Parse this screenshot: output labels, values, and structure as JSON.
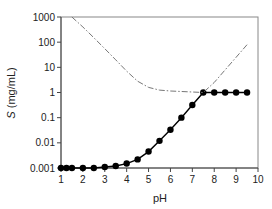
{
  "chart_data": {
    "type": "line",
    "title": "",
    "xlabel": "pH",
    "ylabel_italic": "S",
    "ylabel_rest": " (mg/mL)",
    "ylabel": "S (mg/mL)",
    "xlim": [
      1,
      10
    ],
    "ylim": [
      0.001,
      1000
    ],
    "yscale": "log",
    "grid": false,
    "legend": null,
    "x_ticks": [
      1,
      2,
      3,
      4,
      5,
      6,
      7,
      8,
      9,
      10
    ],
    "x_tick_labels": [
      "1",
      "2",
      "3",
      "4",
      "5",
      "6",
      "7",
      "8",
      "9",
      "10"
    ],
    "y_ticks": [
      0.001,
      0.01,
      0.1,
      1,
      10,
      100,
      1000
    ],
    "y_tick_labels": [
      "0.001",
      "0.01",
      "0.1",
      "1",
      "10",
      "100",
      "1000"
    ],
    "series": [
      {
        "name": "measured solubility",
        "style": "solid-markers",
        "color": "#000000",
        "x": [
          1,
          1.25,
          1.5,
          2,
          2.5,
          3,
          3.5,
          4,
          4.5,
          5,
          5.5,
          6,
          6.5,
          7,
          7.5,
          8,
          8.5,
          9,
          9.5
        ],
        "values": [
          0.001,
          0.001,
          0.001,
          0.001,
          0.001,
          0.0011,
          0.0012,
          0.0015,
          0.0022,
          0.0045,
          0.012,
          0.033,
          0.1,
          0.32,
          1,
          1,
          1,
          1,
          1
        ]
      },
      {
        "name": "theoretical profile",
        "style": "dash-dot",
        "color": "#777777",
        "x": [
          1.5,
          2,
          2.5,
          3,
          3.5,
          4,
          4.5,
          5,
          5.5,
          6,
          6.5,
          7,
          7.5,
          8,
          8.5,
          9,
          9.5
        ],
        "values": [
          1000,
          400,
          150,
          55,
          20,
          7,
          2.8,
          1.6,
          1.25,
          1.15,
          1.1,
          1.05,
          1.0,
          2.5,
          8,
          25,
          80
        ]
      }
    ]
  }
}
